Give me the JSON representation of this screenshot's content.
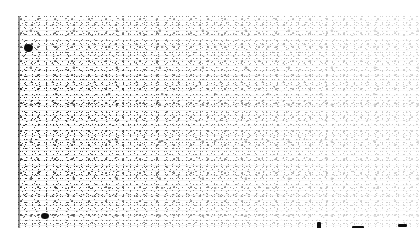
{
  "image": {
    "kind": "degraded-binarized-scan",
    "description": "Heavily degraded black-and-white scanned page fragment consisting of dense salt-and-pepper speckle noise on a white background. No legible text, glyphs, figures or interface chrome are discernible.",
    "width_px": 420,
    "height_px": 248,
    "background_color": "#ffffff",
    "ink_color": "#111111",
    "readable_text": "",
    "legible_content": "none"
  },
  "page": {
    "content_left_px": 18,
    "content_top_px": 16,
    "content_right_px": 420,
    "content_bottom_px": 228,
    "margins": {
      "top_px": 16,
      "left_px": 18,
      "bottom_px": 20,
      "right_px": 0
    }
  },
  "features": {
    "page_edge_left": {
      "name": "page-edge-left",
      "color": "#5a5a5a",
      "x_px": 19,
      "top_px": 16,
      "bottom_px": 228,
      "note": "Thin dark vertical scan/binding edge running the full content height."
    },
    "noise": {
      "type": "salt-and-pepper speckle",
      "polarity": "black speckle on white",
      "density_gradient": "denser at left and lower-left, sparser toward upper right",
      "scanline_striping": true
    },
    "ink_blots": [
      {
        "name": "ink-blot-upper-left",
        "x_px": 24,
        "y_px": 44,
        "width_px": 9,
        "height_px": 8
      },
      {
        "name": "ink-blot-lower-left",
        "x_px": 41,
        "y_px": 213,
        "width_px": 8,
        "height_px": 6
      },
      {
        "name": "ink-mark-bottom-center",
        "x_px": 317,
        "y_px": 222,
        "width_px": 4,
        "height_px": 7
      },
      {
        "name": "ink-mark-bottom-right",
        "x_px": 352,
        "y_px": 226,
        "width_px": 12,
        "height_px": 3
      },
      {
        "name": "ink-mark-bottom-far-right",
        "x_px": 398,
        "y_px": 224,
        "width_px": 9,
        "height_px": 3
      }
    ]
  }
}
